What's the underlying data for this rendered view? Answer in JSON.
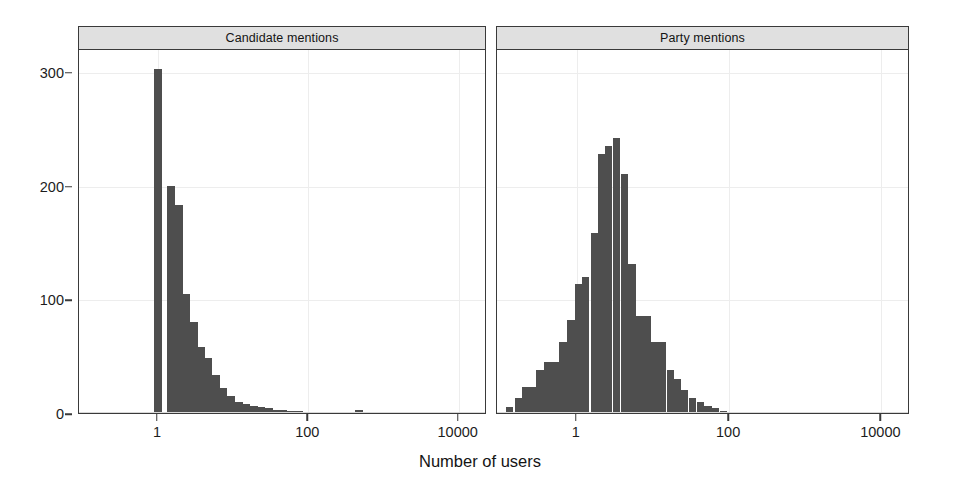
{
  "figure": {
    "xlabel": "Number of users",
    "bar_color": "#4e4e4e",
    "strip_color": "#e0e0e0",
    "frame_color": "#3a3a3a"
  },
  "panels": [
    {
      "title": "Candidate mentions"
    },
    {
      "title": "Party mentions"
    }
  ],
  "axes": {
    "y_ticks": [
      0,
      100,
      200,
      300
    ],
    "y_tick_labels": [
      "0",
      "100",
      "200",
      "300"
    ],
    "y_range": [
      0,
      320
    ],
    "x_ticks": [
      1,
      100,
      10000
    ],
    "x_tick_labels": [
      "1",
      "100",
      "10000"
    ],
    "x_scale": "log10",
    "x_range_log10": [
      -1.05,
      4.35
    ],
    "grid": true
  },
  "chart_data": {
    "type": "bar",
    "title": "",
    "subtitle": "",
    "xlabel": "Number of users",
    "ylabel": "",
    "xscale": "log",
    "xlim": [
      0.089,
      22387
    ],
    "ylim": [
      0,
      320
    ],
    "grid": true,
    "legend": "none",
    "panel_layout": "1 row x 2 columns",
    "bin_width_log10": 0.1,
    "panels": [
      {
        "name": "Candidate mentions",
        "bins_log10_left": [
          -0.05,
          0.15,
          0.25,
          0.35,
          0.45,
          0.55,
          0.65,
          0.75,
          0.85,
          0.95,
          1.05,
          1.15,
          1.25,
          1.35,
          1.45,
          1.55,
          1.65,
          1.75,
          1.85,
          1.95,
          2.05,
          2.15,
          2.25,
          2.45,
          2.65,
          2.85,
          3.05,
          3.25,
          3.45,
          3.55
        ],
        "bin_centers_users": [
          1.0,
          1.5,
          1.9,
          2.4,
          3.0,
          3.8,
          4.7,
          5.9,
          7.5,
          9.4,
          12,
          15,
          19,
          24,
          30,
          38,
          47,
          59,
          75,
          94,
          120,
          150,
          190,
          300,
          470,
          750,
          1200,
          1900,
          3000,
          3900
        ],
        "values": [
          302,
          200,
          183,
          105,
          80,
          58,
          48,
          33,
          22,
          15,
          10,
          8,
          6,
          5,
          4,
          3,
          3,
          2,
          2,
          1,
          1,
          1,
          1,
          0,
          3,
          0,
          0,
          1,
          0,
          0
        ],
        "peak_value": 302,
        "peak_at_users": 1,
        "note": "isolated spike at 1 user, then long right-skewed tail"
      },
      {
        "name": "Party mentions",
        "bin_centers_users": [
          0.13,
          0.17,
          0.21,
          0.26,
          0.33,
          0.42,
          0.53,
          0.66,
          0.84,
          1.05,
          1.3,
          1.7,
          2.1,
          2.6,
          3.3,
          4.2,
          5.3,
          6.6,
          8.4,
          10.5,
          13,
          17,
          21,
          26,
          33,
          42,
          53,
          66,
          84,
          105
        ],
        "values": [
          5,
          13,
          23,
          23,
          38,
          45,
          45,
          62,
          82,
          113,
          120,
          158,
          228,
          235,
          242,
          210,
          131,
          85,
          85,
          62,
          62,
          38,
          30,
          20,
          13,
          10,
          6,
          4,
          2,
          1
        ],
        "peak_value": 242,
        "peak_at_users": 1.7,
        "note": "unimodal bell shape on log scale, truncated near 100 users"
      }
    ]
  }
}
